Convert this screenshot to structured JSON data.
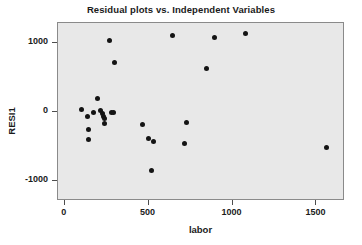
{
  "chart_data": {
    "type": "scatter",
    "title": "Residual plots vs. Independent Variables",
    "xlabel": "labor",
    "ylabel": "RESI1",
    "xlim": [
      -40,
      1670
    ],
    "ylim": [
      -1290,
      1290
    ],
    "xticks": [
      0,
      500,
      1000,
      1500
    ],
    "xtick_labels": [
      "0",
      "500",
      "1000",
      "1500"
    ],
    "yticks": [
      1000,
      0,
      -1000
    ],
    "ytick_labels": [
      "1000",
      "0",
      "-1000"
    ],
    "grid": false,
    "legend": null,
    "marker": "filled-circle",
    "marker_color": "#141414",
    "plot_background": "#e8e8e8",
    "series": [
      {
        "name": "RESI1 vs labor",
        "points": [
          {
            "x": 100,
            "y": 39
          },
          {
            "x": 137,
            "y": -66
          },
          {
            "x": 143,
            "y": -250
          },
          {
            "x": 143,
            "y": -395
          },
          {
            "x": 173,
            "y": -13
          },
          {
            "x": 196,
            "y": 197
          },
          {
            "x": 214,
            "y": 26
          },
          {
            "x": 226,
            "y": -26
          },
          {
            "x": 232,
            "y": -66
          },
          {
            "x": 238,
            "y": -92
          },
          {
            "x": 238,
            "y": -171
          },
          {
            "x": 268,
            "y": 1040
          },
          {
            "x": 280,
            "y": -13
          },
          {
            "x": 292,
            "y": -13
          },
          {
            "x": 298,
            "y": 711
          },
          {
            "x": 464,
            "y": -184
          },
          {
            "x": 500,
            "y": -382
          },
          {
            "x": 518,
            "y": -843
          },
          {
            "x": 530,
            "y": -421
          },
          {
            "x": 643,
            "y": 1106
          },
          {
            "x": 714,
            "y": -461
          },
          {
            "x": 726,
            "y": -158
          },
          {
            "x": 845,
            "y": 632
          },
          {
            "x": 893,
            "y": 1079
          },
          {
            "x": 1077,
            "y": 1145
          },
          {
            "x": 1560,
            "y": -513
          }
        ]
      }
    ]
  }
}
